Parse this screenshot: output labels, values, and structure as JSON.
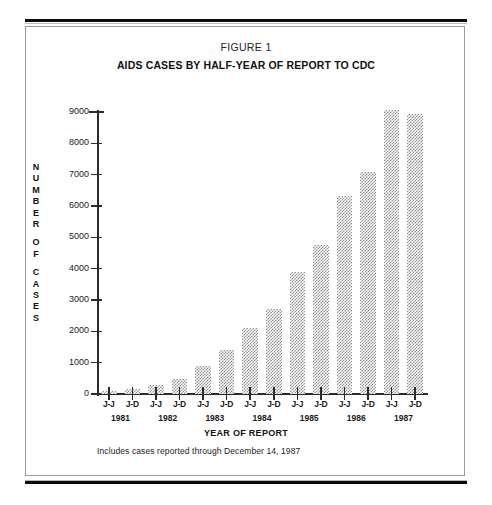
{
  "figure": {
    "label": "FIGURE 1",
    "title": "AIDS CASES BY HALF-YEAR OF REPORT TO CDC",
    "footnote": "Includes cases reported through December 14, 1987"
  },
  "axis": {
    "y_title_letters": [
      "N",
      "U",
      "M",
      "B",
      "E",
      "R",
      "O",
      "F",
      "C",
      "A",
      "S",
      "E",
      "S"
    ],
    "y_title_text": "NUMBER OF CASES",
    "x_title": "YEAR OF REPORT",
    "y_ticks": [
      "0",
      "1000",
      "2000",
      "3000",
      "4000",
      "5000",
      "6000",
      "7000",
      "8000",
      "9000"
    ],
    "years": [
      "1981",
      "1982",
      "1983",
      "1984",
      "1985",
      "1986",
      "1987"
    ],
    "half_labels": [
      "J-J",
      "J-D",
      "J-J",
      "J-D",
      "J-J",
      "J-D",
      "J-J",
      "J-D",
      "J-J",
      "J-D",
      "J-J",
      "J-D",
      "J-J",
      "J-D"
    ]
  },
  "chart_data": {
    "type": "bar",
    "title": "AIDS CASES BY HALF-YEAR OF REPORT TO CDC",
    "subtitle": "FIGURE 1",
    "xlabel": "YEAR OF REPORT",
    "ylabel": "NUMBER OF CASES",
    "ylim": [
      0,
      9000
    ],
    "ytick_values": [
      0,
      1000,
      2000,
      3000,
      4000,
      5000,
      6000,
      7000,
      8000,
      9000
    ],
    "grid": false,
    "legend": "none",
    "bar_fill": "50% checkerboard halftone (gray on white)",
    "categories": [
      "1981 J-J",
      "1981 J-D",
      "1982 J-J",
      "1982 J-D",
      "1983 J-J",
      "1983 J-D",
      "1984 J-J",
      "1984 J-D",
      "1985 J-J",
      "1985 J-D",
      "1986 J-J",
      "1986 J-D",
      "1987 J-J",
      "1987 J-D"
    ],
    "values": [
      100,
      150,
      300,
      480,
      900,
      1400,
      2120,
      2720,
      3900,
      4750,
      6320,
      7070,
      9050,
      8950
    ],
    "annotation": "Includes cases reported through December 14, 1987"
  },
  "colors": {
    "ink": "#1a1a1a",
    "axis": "#2b2b2b",
    "bar_gray": "#8e8e8e",
    "frame": "#9a9a9a",
    "page": "#ffffff"
  }
}
